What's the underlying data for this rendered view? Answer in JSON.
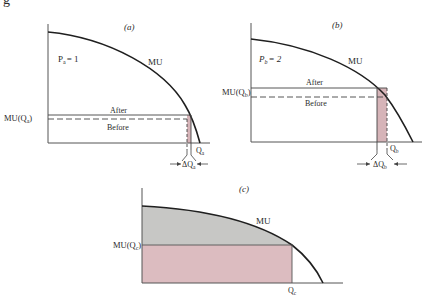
{
  "figure_mark": "g",
  "colors": {
    "axis": "#555555",
    "curve": "#1f1f1f",
    "marginal_fill": "#d6b4b8",
    "surplus_fill": "#c7c7c5",
    "expenditure_fill": "#dcbcc0",
    "accent": "#a33a3a"
  },
  "panels": [
    {
      "id": "a",
      "label": "(a)",
      "price_label": "P",
      "price_sub": "a",
      "price_value": "= 1",
      "curve_label": "MU",
      "y_label": "MU(Q",
      "y_label_sub": "a",
      "y_label_end": ")",
      "after_label": "After",
      "before_label": "Before",
      "q_label": "Q",
      "q_sub": "a",
      "delta_label": "ΔQ",
      "delta_sub": "a"
    },
    {
      "id": "b",
      "label": "(b)",
      "price_label": "P",
      "price_sub": "b",
      "price_value": "= 2",
      "curve_label": "MU",
      "y_label": "MU(Q",
      "y_label_sub": "b",
      "y_label_end": ")",
      "after_label": "After",
      "before_label": "Before",
      "q_label": "Q",
      "q_sub": "b",
      "delta_label": "ΔQ",
      "delta_sub": "b"
    },
    {
      "id": "c",
      "label": "(c)",
      "curve_label": "MU",
      "y_label": "MU(Q",
      "y_label_sub": "c",
      "y_label_end": ")",
      "q_label": "Q",
      "q_sub": "c"
    }
  ]
}
